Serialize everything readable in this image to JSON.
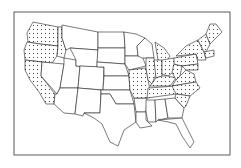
{
  "map": {
    "title": "",
    "region": "Contiguous United States",
    "style": "black-and-white outline map with stippled states",
    "colors": {
      "outline": "#222222",
      "background": "#ffffff",
      "stipple": "#222222"
    },
    "stippled_states": [
      "Washington",
      "Oregon",
      "California (northern/coastal)",
      "Idaho (northern)",
      "Maine",
      "New Hampshire",
      "Vermont",
      "Massachusetts",
      "New York",
      "Pennsylvania",
      "Michigan (lower peninsula)",
      "Ohio",
      "Indiana",
      "Illinois (southern)",
      "Kentucky",
      "Tennessee",
      "West Virginia",
      "Virginia",
      "Maryland",
      "North Carolina",
      "South Carolina",
      "Missouri (southeastern)"
    ],
    "legend": null
  }
}
